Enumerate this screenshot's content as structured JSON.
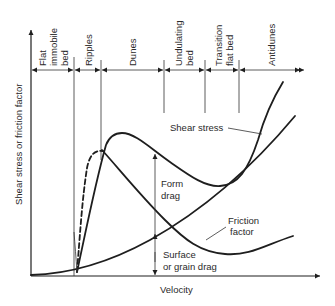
{
  "diagram": {
    "x_axis_label": "Velocity",
    "y_axis_label": "Shear stress or friction factor",
    "regimes": [
      {
        "lines": [
          "Flat",
          "immobile",
          "bed"
        ]
      },
      {
        "lines": [
          "Ripples"
        ]
      },
      {
        "lines": [
          "Dunes"
        ]
      },
      {
        "lines": [
          "Undulating",
          "bed"
        ]
      },
      {
        "lines": [
          "Transition",
          "flat bed"
        ]
      },
      {
        "lines": [
          "Antidunes"
        ]
      }
    ],
    "curves": {
      "shear_stress": "Shear stress",
      "friction_factor_line1": "Friction",
      "friction_factor_line2": "factor"
    },
    "annotations": {
      "form_drag_line1": "Form",
      "form_drag_line2": "drag",
      "surface_drag_line1": "Surface",
      "surface_drag_line2": "or grain drag"
    },
    "colors": {
      "line": "#1e1e1e",
      "background": "#ffffff"
    }
  }
}
